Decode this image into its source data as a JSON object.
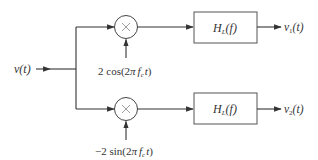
{
  "diagram": {
    "type": "block-diagram",
    "input": {
      "label": "v(t)"
    },
    "branches": [
      {
        "id": "upper",
        "multiplier": {
          "symbol": "×"
        },
        "carrier": {
          "prefix": "2 cos(2",
          "pi": "π",
          "f": "f",
          "sub": "c",
          "t": "t",
          "suffix": ")"
        },
        "filter": {
          "H": "H",
          "sub": "L",
          "arg": "(f)"
        },
        "output": {
          "v": "v",
          "sub": "1",
          "arg": "(t)"
        }
      },
      {
        "id": "lower",
        "multiplier": {
          "symbol": "×"
        },
        "carrier": {
          "prefix": "−2 sin(2",
          "pi": "π",
          "f": "f",
          "sub": "c",
          "t": "t",
          "suffix": ")"
        },
        "filter": {
          "H": "H",
          "sub": "L",
          "arg": "(f)"
        },
        "output": {
          "v": "v",
          "sub": "2",
          "arg": "(t)"
        }
      }
    ],
    "colors": {
      "line": "#333333",
      "box_border": "#555555",
      "text": "#333333"
    }
  }
}
